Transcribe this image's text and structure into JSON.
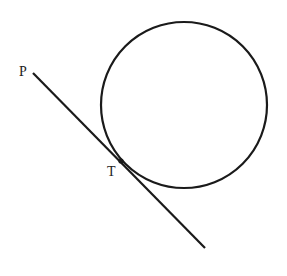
{
  "diagram": {
    "type": "geometry",
    "circle": {
      "cx": 184,
      "cy": 105,
      "r": 83
    },
    "tangent_line": {
      "x1": 33,
      "y1": 73,
      "x2": 205,
      "y2": 248
    },
    "tangent_point": {
      "x": 121,
      "y": 161
    },
    "labels": {
      "P": "P",
      "T": "T"
    },
    "stroke_color": "#1a1a1a"
  }
}
